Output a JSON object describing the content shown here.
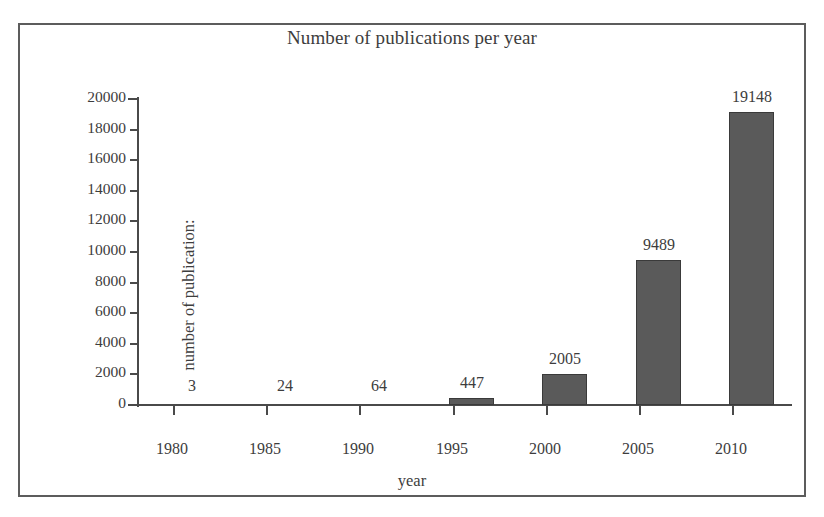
{
  "figure": {
    "background_color": "#ffffff",
    "frame_color": "#5c5c5c",
    "bar_color": "#5a5a5a",
    "bar_border_color": "#3a3a3a",
    "axis_color": "#4a4a4a",
    "text_color": "#3d3d3d"
  },
  "chart_data": {
    "type": "bar",
    "title": "Number of publications per year",
    "xlabel": "year",
    "ylabel": "number of publication:",
    "categories": [
      "1980",
      "1985",
      "1990",
      "1995",
      "2000",
      "2005",
      "2010"
    ],
    "values": [
      3,
      24,
      64,
      447,
      2005,
      9489,
      19148
    ],
    "value_labels": [
      "3",
      "24",
      "64",
      "447",
      "2005",
      "9489",
      "19148"
    ],
    "ylim": [
      0,
      20000
    ],
    "ytick_labels": [
      "20000",
      "18000",
      "16000",
      "14000",
      "12000",
      "10000",
      "8000",
      "6000",
      "4000",
      "2000",
      "0"
    ],
    "ytick_values": [
      20000,
      18000,
      16000,
      14000,
      12000,
      10000,
      8000,
      6000,
      4000,
      2000,
      0
    ],
    "xtick_labels": [
      "1980",
      "1985",
      "1990",
      "1995",
      "2000",
      "2005",
      "2010"
    ],
    "grid": false,
    "legend": null,
    "legend_position": "none",
    "series": [
      {
        "name": "publications",
        "values": [
          3,
          24,
          64,
          447,
          2005,
          9489,
          19148
        ]
      }
    ]
  }
}
